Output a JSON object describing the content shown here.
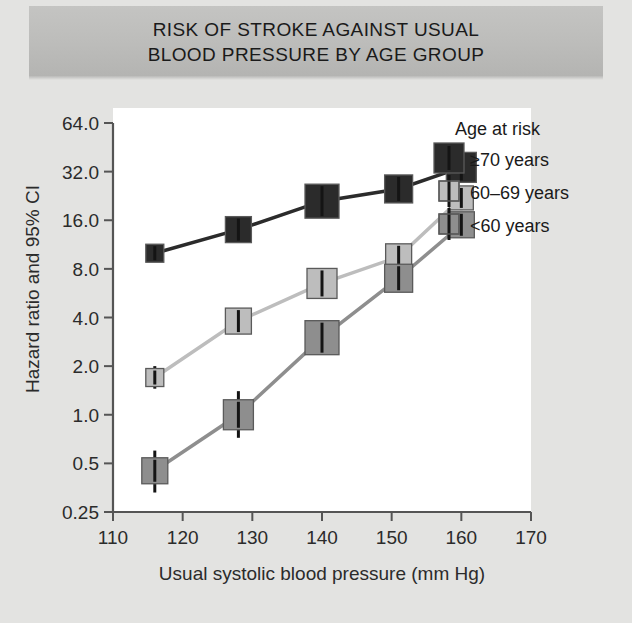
{
  "banner": {
    "line1": "RISK OF STROKE AGAINST USUAL",
    "line2": "BLOOD PRESSURE BY AGE GROUP"
  },
  "axes": {
    "ylabel": "Hazard ratio and 95% CI",
    "xlabel": "Usual systolic blood pressure (mm Hg)",
    "yticks": [
      "64.0",
      "32.0",
      "16.0",
      "8.0",
      "4.0",
      "2.0",
      "1.0",
      "0.5",
      "0.25"
    ],
    "xticks": [
      "110",
      "120",
      "130",
      "140",
      "150",
      "160",
      "170"
    ]
  },
  "legend": {
    "title": "Age at risk",
    "items": [
      {
        "label": "≥70 years",
        "color": "#2b2b2b"
      },
      {
        "label": "60–69 years",
        "color": "#bdbdbd"
      },
      {
        "label": "<60 years",
        "color": "#8e8e8e"
      }
    ]
  },
  "chart_data": {
    "type": "scatter",
    "title": "RISK OF STROKE AGAINST USUAL BLOOD PRESSURE BY AGE GROUP",
    "xlabel": "Usual systolic blood pressure (mm Hg)",
    "ylabel": "Hazard ratio and 95% CI",
    "xlim": [
      110,
      170
    ],
    "ylim": [
      0.25,
      64.0
    ],
    "yscale": "log2",
    "ytick_values": [
      64.0,
      32.0,
      16.0,
      8.0,
      4.0,
      2.0,
      1.0,
      0.5,
      0.25
    ],
    "xtick_values": [
      110,
      120,
      130,
      140,
      150,
      160,
      170
    ],
    "grid": false,
    "legend_position": "top-right",
    "legend_title": "Age at risk",
    "series": [
      {
        "name": "≥70 years",
        "color": "#2b2b2b",
        "x": [
          116,
          128,
          140,
          151,
          160
        ],
        "y": [
          10.0,
          14.0,
          21.0,
          25.0,
          34.0
        ],
        "ci_low": [
          9.0,
          12.6,
          18.5,
          22.0,
          30.0
        ],
        "ci_high": [
          11.2,
          15.6,
          23.8,
          28.5,
          38.0
        ],
        "marker_size": [
          18,
          26,
          34,
          28,
          30
        ]
      },
      {
        "name": "60–69 years",
        "color": "#bdbdbd",
        "x": [
          116,
          128,
          140,
          151,
          160
        ],
        "y": [
          1.7,
          3.8,
          6.5,
          9.5,
          22.0
        ],
        "ci_low": [
          1.45,
          3.25,
          5.7,
          8.3,
          18.5
        ],
        "ci_high": [
          2.0,
          4.45,
          7.4,
          10.8,
          26.0
        ],
        "marker_size": [
          18,
          26,
          30,
          26,
          24
        ]
      },
      {
        "name": "<60 years",
        "color": "#8e8e8e",
        "x": [
          116,
          128,
          140,
          151,
          160
        ],
        "y": [
          0.45,
          1.0,
          3.0,
          7.0,
          15.0
        ],
        "ci_low": [
          0.33,
          0.72,
          2.35,
          5.9,
          12.5
        ],
        "ci_high": [
          0.6,
          1.4,
          3.8,
          8.3,
          18.0
        ],
        "marker_size": [
          26,
          30,
          34,
          28,
          26
        ]
      }
    ]
  }
}
